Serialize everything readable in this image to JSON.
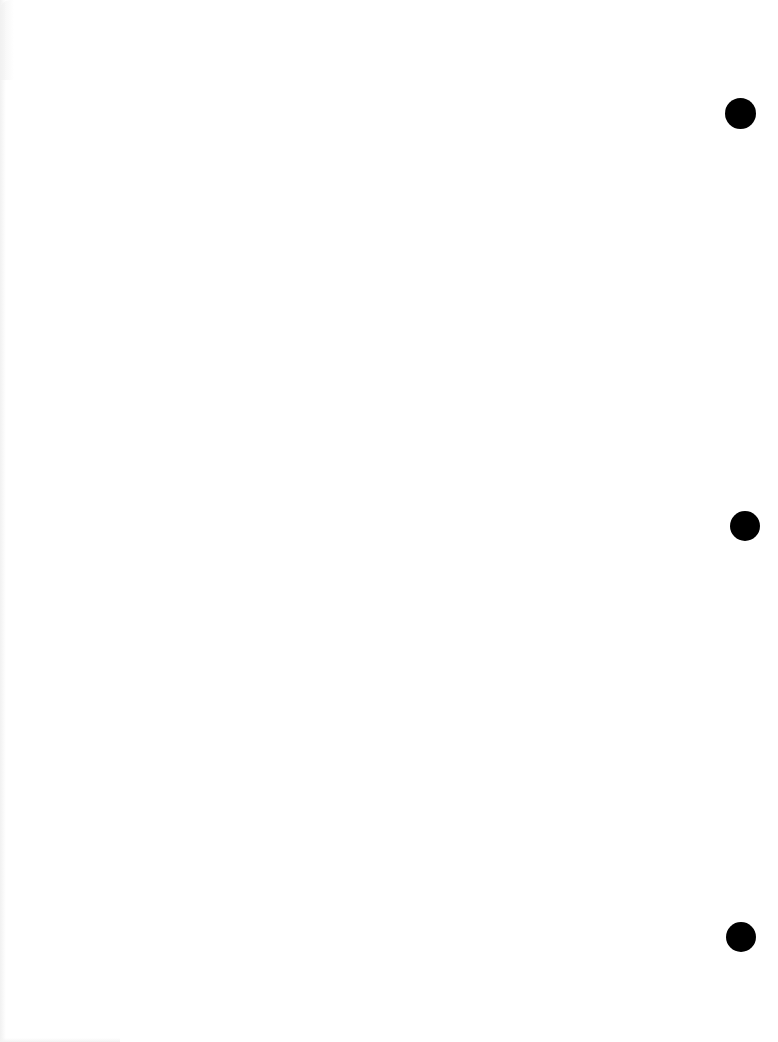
{
  "document": {
    "type": "blank-page",
    "text": "",
    "background_color": "#ffffff"
  },
  "punch_holes": [
    {
      "cx": 740,
      "cy": 113,
      "d": 31,
      "color": "#000000"
    },
    {
      "cx": 745,
      "cy": 526,
      "d": 30,
      "color": "#000000"
    },
    {
      "cx": 741,
      "cy": 937,
      "d": 30,
      "color": "#000000"
    }
  ]
}
